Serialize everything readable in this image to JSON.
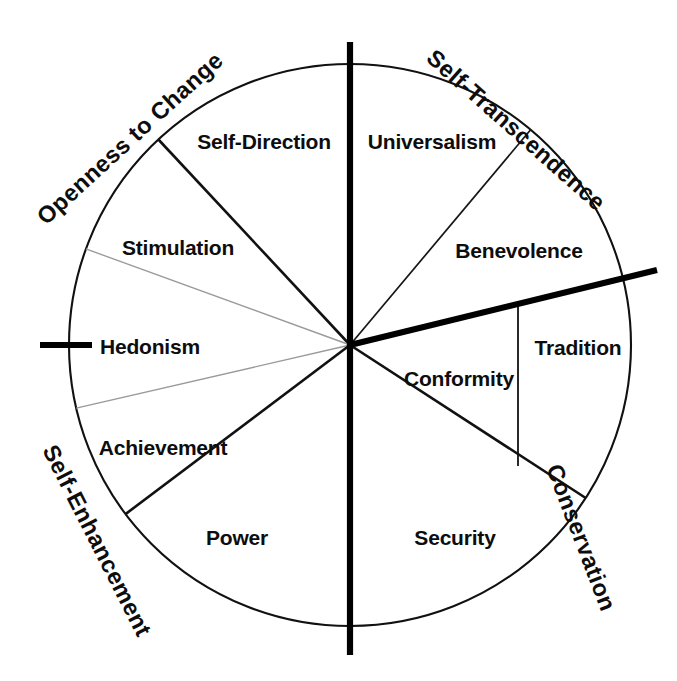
{
  "figure": {
    "name": "schwartz-circular-values-model",
    "background_color": "#ffffff",
    "ink_color": "#111111",
    "faint_line_color": "#9a9a9a"
  },
  "geometry": {
    "center_x": 350,
    "center_y": 345,
    "radius": 281
  },
  "wedges": [
    {
      "key": "self_direction",
      "label": "Self-Direction",
      "label_x": 264,
      "label_y": 141,
      "start_deg": 66,
      "end_deg": 133
    },
    {
      "key": "stimulation",
      "label": "Stimulation",
      "label_x": 178,
      "label_y": 247,
      "start_deg": 133,
      "end_deg": 160
    },
    {
      "key": "hedonism",
      "label": "Hedonism",
      "label_x": 148,
      "label_y": 346,
      "start_deg": 160,
      "end_deg": 193
    },
    {
      "key": "achievement",
      "label": "Achievement",
      "label_x": 163,
      "label_y": 447,
      "start_deg": 193,
      "end_deg": 217
    },
    {
      "key": "power",
      "label": "Power",
      "label_x": 237,
      "label_y": 537,
      "start_deg": 217,
      "end_deg": 270
    },
    {
      "key": "security",
      "label": "Security",
      "label_x": 455,
      "label_y": 537,
      "start_deg": 270,
      "end_deg": 327
    },
    {
      "key": "conformity",
      "label": "Conformity",
      "label_x": 459,
      "label_y": 378,
      "start_deg": 327,
      "end_deg": 346
    },
    {
      "key": "tradition",
      "label": "Tradition",
      "label_x": 578,
      "label_y": 347,
      "start_deg": 327,
      "end_deg": 346
    },
    {
      "key": "benevolence",
      "label": "Benevolence",
      "label_x": 519,
      "label_y": 250,
      "start_deg": 14,
      "end_deg": 50
    },
    {
      "key": "universalism",
      "label": "Universalism",
      "label_x": 432,
      "label_y": 141,
      "start_deg": 50,
      "end_deg": 90
    }
  ],
  "dimensions": [
    {
      "key": "openness_to_change",
      "label": "Openness to Change",
      "angle_deg": -42.5,
      "anchor_x": 46,
      "anchor_y": 226
    },
    {
      "key": "self_transcendence",
      "label": "Self-Transcendence",
      "angle_deg": 41.5,
      "anchor_x": 425,
      "anchor_y": 60
    },
    {
      "key": "conservation",
      "label": "Conservation",
      "angle_deg": -48,
      "anchor_x": 546,
      "anchor_y": 468
    },
    {
      "key": "self_enhancement",
      "label": "Self-Enhancement",
      "angle_deg": 50,
      "anchor_x": 42,
      "anchor_y": 450
    }
  ],
  "axes": [
    {
      "key": "vertical-axis",
      "orientation": "vertical",
      "x1": 350,
      "y1": 42,
      "x2": 350,
      "y2": 655
    },
    {
      "key": "left-tick",
      "orientation": "horizontal",
      "x1": 40,
      "y1": 345,
      "x2": 92,
      "y2": 345
    },
    {
      "key": "thick-radial-arrow",
      "orientation": "diagonal",
      "x1": 350,
      "y1": 345,
      "x2": 657,
      "y2": 270
    }
  ],
  "spokes": [
    {
      "key": "self-direction-universalism-boundary",
      "style": "heavy-vertical",
      "angle_deg": 90
    },
    {
      "key": "self-direction-stimulation-boundary",
      "style": "solid",
      "angle_deg": 133
    },
    {
      "key": "stimulation-hedonism-boundary",
      "style": "faint",
      "angle_deg": 160
    },
    {
      "key": "hedonism-achievement-boundary",
      "style": "faint",
      "angle_deg": 193
    },
    {
      "key": "achievement-power-boundary",
      "style": "solid",
      "angle_deg": 217
    },
    {
      "key": "power-security-boundary",
      "style": "heavy-vertical",
      "angle_deg": 270
    },
    {
      "key": "security-conformity-boundary",
      "style": "solid",
      "angle_deg": 327
    },
    {
      "key": "conformity-tradition-outer-boundary",
      "style": "thick",
      "angle_deg": 346
    },
    {
      "key": "benevolence-tradition-boundary",
      "style": "thick",
      "angle_deg": 346
    },
    {
      "key": "universalism-benevolence-boundary",
      "style": "thin",
      "angle_deg": 50
    }
  ],
  "subdivider": {
    "key": "conformity-tradition-divider",
    "x1": 518,
    "y1": 303,
    "x2": 518,
    "y2": 466
  }
}
